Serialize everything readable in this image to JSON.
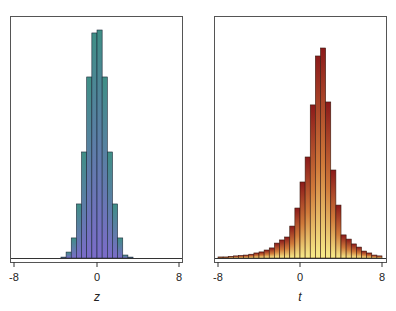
{
  "chart_data": [
    {
      "type": "bar",
      "title": "",
      "xlabel": "z",
      "ylabel": "",
      "xlim": [
        -8,
        8
      ],
      "xticks": [
        "-8",
        "0",
        "8"
      ],
      "bin_width": 0.5,
      "bin_start": -3.5,
      "grid": false,
      "legend": null,
      "fill_gradient": {
        "top": "#3f8f86",
        "bottom": "#7b6cc9"
      },
      "values": [
        0.004,
        0.026,
        0.088,
        0.237,
        0.465,
        0.794,
        0.987,
        1.0,
        0.794,
        0.465,
        0.237,
        0.088,
        0.013,
        0.004
      ]
    },
    {
      "type": "bar",
      "title": "",
      "xlabel": "t",
      "ylabel": "",
      "xlim": [
        -8,
        8
      ],
      "xticks": [
        "-8",
        "0",
        "8"
      ],
      "bin_width": 0.5,
      "bin_start": -8,
      "grid": false,
      "legend": null,
      "fill_gradient": {
        "top": "#8b1a1a",
        "bottom": "#f7ec8a"
      },
      "values": [
        0.005,
        0.005,
        0.008,
        0.01,
        0.012,
        0.014,
        0.018,
        0.024,
        0.029,
        0.038,
        0.048,
        0.071,
        0.086,
        0.1,
        0.152,
        0.238,
        0.362,
        0.481,
        0.729,
        0.962,
        1.0,
        0.743,
        0.419,
        0.252,
        0.11,
        0.09,
        0.067,
        0.052,
        0.033,
        0.024,
        0.014,
        0.01
      ]
    }
  ],
  "panels": [
    {
      "xlabel": "z",
      "ticks": [
        "-8",
        "0",
        "8"
      ]
    },
    {
      "xlabel": "t",
      "ticks": [
        "-8",
        "0",
        "8"
      ]
    }
  ]
}
